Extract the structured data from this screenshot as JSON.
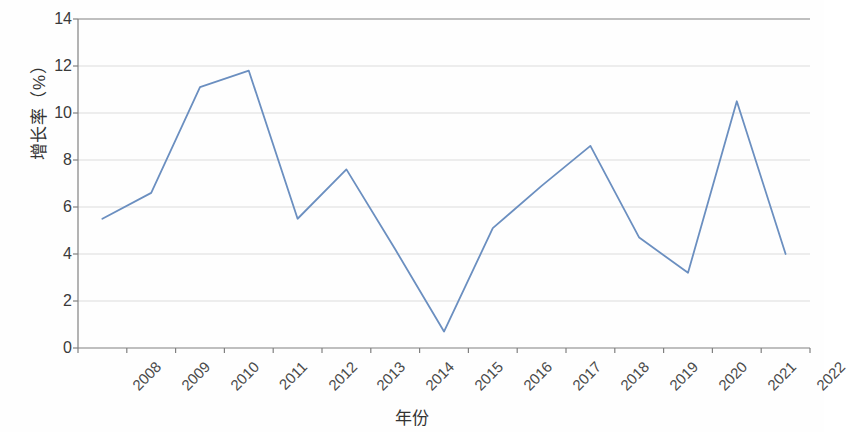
{
  "chart_data": {
    "type": "line",
    "title": "",
    "xlabel": "年份",
    "ylabel": "增长率（%）",
    "categories": [
      "2008",
      "2009",
      "2010",
      "2011",
      "2012",
      "2013",
      "2014",
      "2015",
      "2016",
      "2017",
      "2018",
      "2019",
      "2020",
      "2021",
      "2022"
    ],
    "values": [
      5.5,
      6.6,
      11.1,
      11.8,
      5.5,
      7.6,
      4.2,
      0.7,
      5.1,
      6.9,
      8.6,
      4.7,
      3.2,
      10.5,
      4.0
    ],
    "series": [
      {
        "name": "增长率",
        "values": [
          5.5,
          6.6,
          11.1,
          11.8,
          5.5,
          7.6,
          4.2,
          0.7,
          5.1,
          6.9,
          8.6,
          4.7,
          3.2,
          10.5,
          4.0
        ]
      }
    ],
    "ylim": [
      0,
      14
    ],
    "yticks": [
      0,
      2,
      4,
      6,
      8,
      10,
      12,
      14
    ],
    "ytick_labels": [
      "0",
      "2",
      "4",
      "6",
      "8",
      "10",
      "12",
      "14"
    ],
    "grid": true,
    "grid_axis": "y",
    "legend": false,
    "legend_position": "none",
    "xtick_rotation": -45,
    "markers": false,
    "colors": {
      "line": "#6b8fc0",
      "grid": "#dcdcdc",
      "axis": "#808080",
      "tick_text": "#3a3a3a",
      "title_text": "#333333",
      "background": "#fefefe"
    }
  }
}
